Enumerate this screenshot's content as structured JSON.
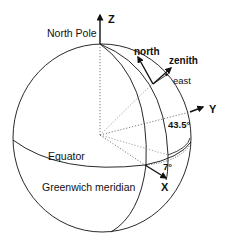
{
  "diagram": {
    "type": "earth-coordinate-system",
    "labels": {
      "north_pole": "North Pole",
      "z_axis": "Z",
      "y_axis": "Y",
      "x_axis": "X",
      "north": "north",
      "zenith": "zenith",
      "east": "east",
      "equator": "Equator",
      "greenwich": "Greenwich meridian",
      "latitude_angle": "43.5°",
      "longitude_angle": "7°"
    },
    "colors": {
      "line": "#111111",
      "dotted": "#555555",
      "background": "#ffffff"
    }
  }
}
